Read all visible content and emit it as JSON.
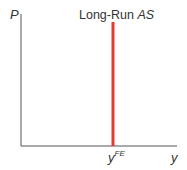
{
  "diagram": {
    "title": "Long-Run AS",
    "curve_label_main": "Long-Run ",
    "curve_label_italic": "AS",
    "y_axis_label": "P",
    "x_axis_label": "y",
    "marker_label_base": "y",
    "marker_label_sup": "FE",
    "colors": {
      "axis": "#555555",
      "curve": "#e53b2f",
      "text": "#333333"
    }
  }
}
